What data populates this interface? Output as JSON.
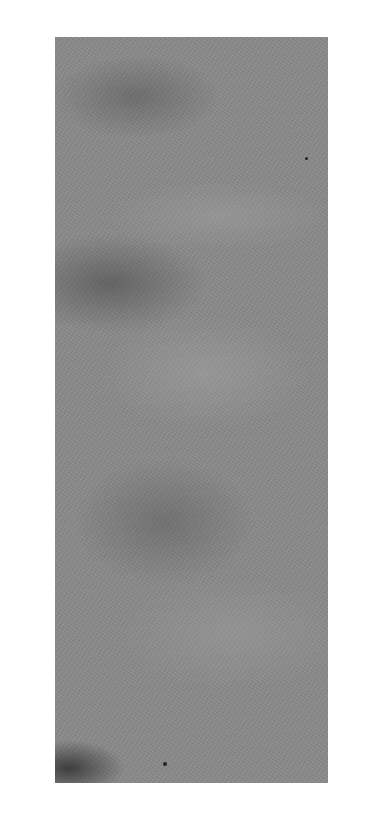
{
  "image": {
    "subject": "textured grey surface (stone/paper) panel",
    "colors": {
      "background": "#ffffff",
      "surface_mid": "#8a8a8a",
      "surface_dark": "#505050",
      "surface_light": "#b0b0b0"
    },
    "stamp_text": ""
  }
}
